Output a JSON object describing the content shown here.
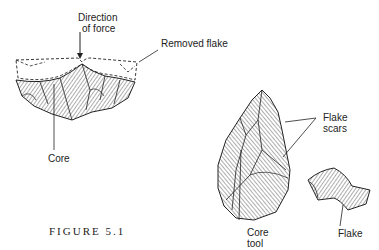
{
  "figure": {
    "caption": "FIGURE 5.1",
    "labels": {
      "direction_of_force_line1": "Direction",
      "direction_of_force_line2": "of force",
      "removed_flake": "Removed flake",
      "core": "Core",
      "flake_scars_line1": "Flake",
      "flake_scars_line2": "scars",
      "core_tool_line1": "Core",
      "core_tool_line2": "tool",
      "flake": "Flake"
    }
  },
  "colors": {
    "ink": "#222222",
    "background": "#ffffff"
  }
}
